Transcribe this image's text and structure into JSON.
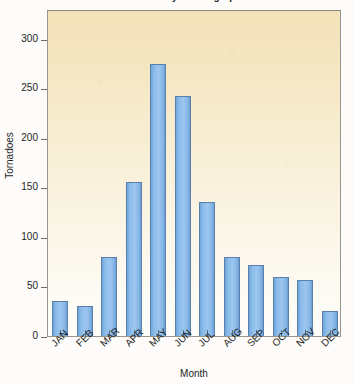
{
  "chart_data": {
    "type": "bar",
    "title": "Tornadoes by month graph",
    "xlabel": "Month",
    "ylabel": "Tornadoes",
    "categories": [
      "JAN",
      "FEB",
      "MAR",
      "APR",
      "MAY",
      "JUN",
      "JUL",
      "AUG",
      "SEP",
      "OCT",
      "NOV",
      "DEC"
    ],
    "values": [
      35,
      30,
      80,
      155,
      275,
      242,
      135,
      80,
      72,
      60,
      57,
      25
    ],
    "ylim": [
      0,
      330
    ],
    "yticks": [
      0,
      50,
      100,
      150,
      200,
      250,
      300
    ],
    "ytick_labels": [
      "0",
      "50",
      "100",
      "150",
      "200",
      "250",
      "300"
    ],
    "grid": false,
    "legend": false,
    "bar_color": "#8cbcea",
    "bar_border_color": "#5a7fa8",
    "plot_bg_top": "#f3e2b9",
    "plot_bg_bottom": "#fefdfa",
    "axis_color": "#6e6a64",
    "label_rotation": -45
  }
}
